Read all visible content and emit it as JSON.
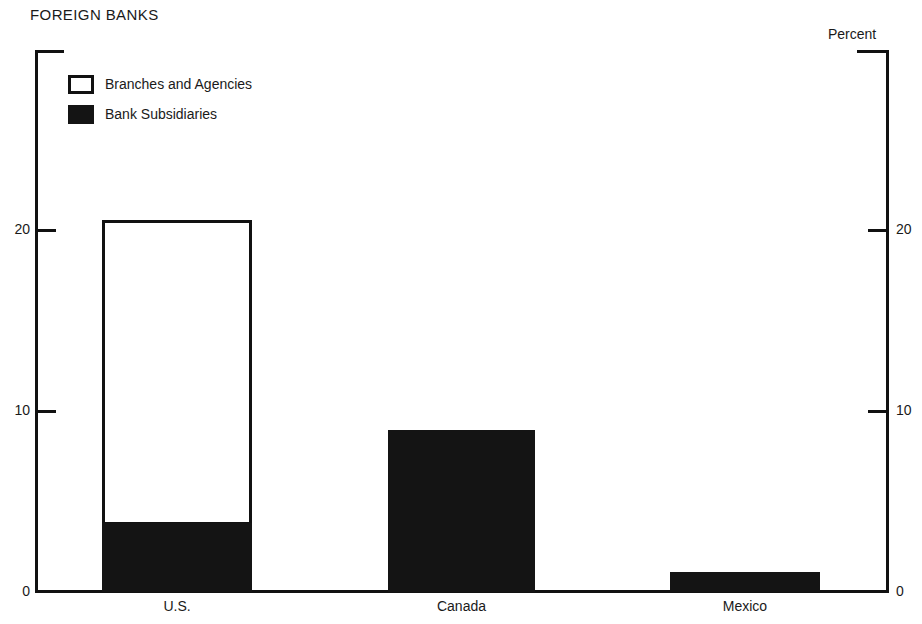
{
  "chart_data": {
    "type": "bar",
    "title": "FOREIGN BANKS",
    "subtitle": "",
    "xlabel": "",
    "ylabel": "",
    "unit_label": "Percent",
    "categories": [
      "U.S.",
      "Canada",
      "Mexico"
    ],
    "stacked": true,
    "series": [
      {
        "name": "Bank Subsidiaries",
        "style": "filled",
        "values": [
          3.8,
          8.9,
          1.1
        ]
      },
      {
        "name": "Branches and Agencies",
        "style": "open",
        "values": [
          16.7,
          0,
          0
        ]
      }
    ],
    "totals": [
      20.5,
      8.9,
      1.1
    ],
    "ylim": [
      0,
      27
    ],
    "yticks": [
      0,
      10,
      20
    ],
    "ytick_labels": [
      "0",
      "10",
      "20"
    ],
    "right_axis_ticks": [
      0,
      10,
      20
    ],
    "right_axis_tick_labels": [
      "0",
      "10",
      "20"
    ],
    "grid": false,
    "legend_position": "top-left",
    "colors": {
      "filled": "#141414",
      "open": "#ffffff",
      "outline": "#111111",
      "text": "#1a1a1a",
      "background": "#ffffff"
    }
  },
  "legend": {
    "items": [
      {
        "label": "Branches and Agencies",
        "swatch": "open-square-swatch"
      },
      {
        "label": "Bank Subsidiaries",
        "swatch": "filled-square-swatch"
      }
    ]
  }
}
